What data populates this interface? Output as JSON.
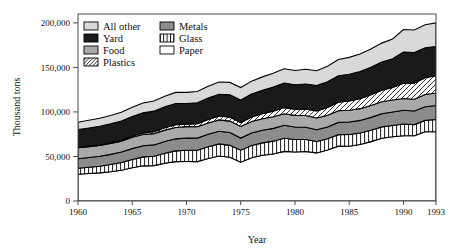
{
  "chart_data": {
    "type": "area",
    "title": "",
    "xlabel": "Year",
    "ylabel": "Thousand tons",
    "stacked": true,
    "grid": false,
    "legend_position": "top-left-inside",
    "xlim": [
      1960,
      1993
    ],
    "ylim": [
      0,
      210000
    ],
    "yticks": [
      0,
      50000,
      100000,
      150000,
      200000
    ],
    "ytick_labels": [
      "0",
      "50,000",
      "100,000",
      "150,000",
      "200,000"
    ],
    "xticks": [
      1960,
      1965,
      1970,
      1975,
      1980,
      1985,
      1990,
      1993
    ],
    "xtick_labels": [
      "1960",
      "1965",
      "1970",
      "1975",
      "1980",
      "1985",
      "1990",
      "1993"
    ],
    "x": [
      1960,
      1961,
      1962,
      1963,
      1964,
      1965,
      1966,
      1967,
      1968,
      1969,
      1970,
      1971,
      1972,
      1973,
      1974,
      1975,
      1976,
      1977,
      1978,
      1979,
      1980,
      1981,
      1982,
      1983,
      1984,
      1985,
      1986,
      1987,
      1988,
      1989,
      1990,
      1991,
      1992,
      1993
    ],
    "stack_order_bottom_to_top": [
      "Paper",
      "Glass",
      "Metals",
      "Food",
      "Plastics",
      "Yard",
      "All other"
    ],
    "series": [
      {
        "name": "Paper",
        "pattern": "solid-white",
        "color": "#ffffff",
        "values": [
          29990,
          30800,
          31600,
          32900,
          34600,
          37400,
          39500,
          39700,
          42300,
          44200,
          44310,
          44200,
          47800,
          50500,
          49100,
          43570,
          48600,
          51300,
          52800,
          55700,
          54990,
          55600,
          54000,
          57200,
          61600,
          61480,
          63400,
          66700,
          70400,
          72100,
          73330,
          73200,
          77800,
          77800
        ]
      },
      {
        "name": "Glass",
        "pattern": "vertical-stripes",
        "color": "#ffffff",
        "values": [
          6720,
          7100,
          7500,
          8000,
          8600,
          9300,
          10000,
          10600,
          11400,
          12100,
          12740,
          12800,
          13200,
          13600,
          13400,
          13470,
          13800,
          14000,
          14400,
          14700,
          14080,
          13500,
          12800,
          12600,
          12900,
          13190,
          12900,
          12800,
          12800,
          12700,
          13100,
          12600,
          12700,
          13700
        ]
      },
      {
        "name": "Metals",
        "pattern": "solid-dark-gray",
        "color": "#8c8c8c",
        "values": [
          10820,
          11000,
          11200,
          11500,
          11800,
          12100,
          12500,
          12700,
          13200,
          13500,
          13620,
          13600,
          13900,
          14200,
          14400,
          13640,
          13900,
          14100,
          14400,
          14600,
          14100,
          13800,
          13300,
          13400,
          13800,
          14080,
          14200,
          14400,
          14800,
          15100,
          15480,
          15200,
          15400,
          15800
        ]
      },
      {
        "name": "Food",
        "pattern": "solid-mid-gray",
        "color": "#a9a9a9",
        "values": [
          12200,
          12200,
          12200,
          12200,
          12200,
          12700,
          12700,
          12700,
          12700,
          12700,
          12800,
          12800,
          12800,
          12800,
          12800,
          13000,
          13000,
          13000,
          13000,
          13000,
          13000,
          13100,
          13100,
          13100,
          13100,
          13200,
          13200,
          13300,
          13400,
          13500,
          13200,
          13300,
          13700,
          14000
        ]
      },
      {
        "name": "Plastics",
        "pattern": "diagonal-hatch",
        "color": "#ffffff",
        "values": [
          390,
          500,
          650,
          800,
          1000,
          1400,
          1800,
          2200,
          2700,
          3100,
          2900,
          3300,
          3800,
          4300,
          4500,
          4400,
          5000,
          5600,
          6300,
          6900,
          6830,
          7400,
          7900,
          8600,
          9600,
          10340,
          11200,
          12000,
          13000,
          14200,
          17130,
          18000,
          18900,
          19300
        ]
      },
      {
        "name": "Yard",
        "pattern": "solid-black",
        "color": "#1a1a1a",
        "values": [
          20000,
          20400,
          20800,
          21200,
          21600,
          22000,
          22500,
          23000,
          23400,
          23900,
          23200,
          23600,
          24100,
          24500,
          25000,
          25230,
          25800,
          26400,
          27000,
          27500,
          27500,
          28000,
          28500,
          29000,
          29600,
          30000,
          30500,
          31000,
          31600,
          32200,
          35000,
          34500,
          33500,
          32800
        ]
      },
      {
        "name": "All other",
        "pattern": "solid-light-gray",
        "color": "#d9d9d9",
        "values": [
          8280,
          8600,
          9000,
          9400,
          9900,
          10400,
          11000,
          11400,
          12000,
          12500,
          12430,
          12700,
          13200,
          13700,
          14000,
          14090,
          14500,
          15000,
          15600,
          16100,
          16100,
          16600,
          16700,
          17400,
          18300,
          19000,
          19600,
          20400,
          21300,
          22200,
          25360,
          25300,
          25900,
          26600
        ]
      }
    ],
    "totals": [
      88400,
      90600,
      93150,
      96000,
      99700,
      105300,
      110000,
      112300,
      117700,
      122000,
      121800,
      123000,
      128800,
      134600,
      133200,
      127400,
      134600,
      139400,
      143500,
      148500,
      146600,
      148000,
      146300,
      151300,
      158900,
      161290,
      165000,
      170600,
      177300,
      182000,
      192600,
      192100,
      197900,
      200000
    ]
  },
  "legend": {
    "items": [
      {
        "label": "All other",
        "swatch": "solid-light-gray"
      },
      {
        "label": "Metals",
        "swatch": "solid-dark-gray"
      },
      {
        "label": "Yard",
        "swatch": "solid-black"
      },
      {
        "label": "Glass",
        "swatch": "vertical-stripes"
      },
      {
        "label": "Food",
        "swatch": "solid-mid-gray"
      },
      {
        "label": "Paper",
        "swatch": "solid-white"
      },
      {
        "label": "Plastics",
        "swatch": "diagonal-hatch"
      }
    ]
  },
  "colors": {
    "all_other": "#d9d9d9",
    "yard": "#1a1a1a",
    "food": "#a9a9a9",
    "metals": "#8c8c8c",
    "glass": "#ffffff",
    "paper": "#ffffff",
    "plastics": "#ffffff",
    "outline": "#000000",
    "frame": "#4d4d4d",
    "background": "#ffffff"
  }
}
